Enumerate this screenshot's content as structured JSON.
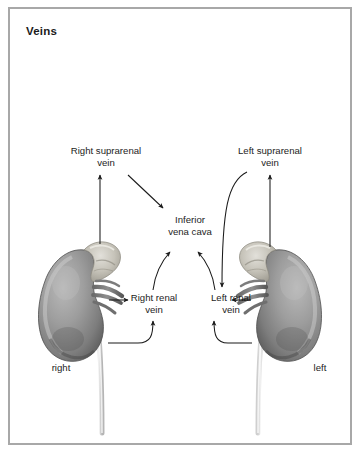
{
  "figure": {
    "title": "Veins",
    "border_color": "#a8a8a8",
    "background_color": "#ffffff",
    "text_color": "#1d1d1d",
    "line_color": "#1a1a1a"
  },
  "labels": {
    "right_suprarenal_vein": "Right suprarenal\nvein",
    "left_suprarenal_vein": "Left suprarenal\nvein",
    "inferior_vena_cava": "Inferior\nvena cava",
    "right_renal_vein": "Right renal\nvein",
    "left_renal_vein": "Left renal\nvein",
    "side_right": "right",
    "side_left": "left"
  },
  "anatomy": {
    "right_kidney": "right-kidney-illustration",
    "left_kidney": "left-kidney-illustration",
    "right_adrenal_gland": "right-suprarenal-gland",
    "left_adrenal_gland": "left-suprarenal-gland",
    "right_ureter": "right-ureter",
    "left_ureter": "left-ureter"
  },
  "connectors": [
    {
      "name": "arrow-right-suprarenal-vein",
      "from": "right-kidney-adrenal",
      "to": "right_suprarenal_vein",
      "style": "straight-up"
    },
    {
      "name": "arrow-right-suprarenal-to-ivc",
      "from": "right_suprarenal_vein",
      "to": "inferior_vena_cava",
      "style": "diagonal-down-right"
    },
    {
      "name": "arrow-left-suprarenal-vein",
      "from": "left-kidney-adrenal",
      "to": "left_suprarenal_vein",
      "style": "straight-up"
    },
    {
      "name": "arrow-left-suprarenal-to-left-renal",
      "from": "left_suprarenal_vein",
      "to": "left_renal_vein",
      "style": "curved-down"
    },
    {
      "name": "arrow-right-renal-to-ivc",
      "from": "right_renal_vein",
      "to": "inferior_vena_cava",
      "style": "curved-up-right"
    },
    {
      "name": "arrow-left-renal-to-ivc",
      "from": "left_renal_vein",
      "to": "inferior_vena_cava",
      "style": "curved-up-left"
    },
    {
      "name": "arrow-right-hilum-to-right-renal",
      "from": "right-kidney-hilum",
      "to": "right_renal_vein",
      "style": "straight-right"
    },
    {
      "name": "arrow-left-hilum-to-left-renal",
      "from": "left-kidney-hilum",
      "to": "left_renal_vein",
      "style": "straight-left"
    },
    {
      "name": "leader-right-ureter-to-right-renal",
      "from": "right-ureter",
      "to": "right_renal_vein",
      "style": "elbow-curve-up"
    },
    {
      "name": "leader-left-ureter-to-left-renal",
      "from": "left-ureter",
      "to": "left_renal_vein",
      "style": "elbow-curve-up"
    }
  ]
}
